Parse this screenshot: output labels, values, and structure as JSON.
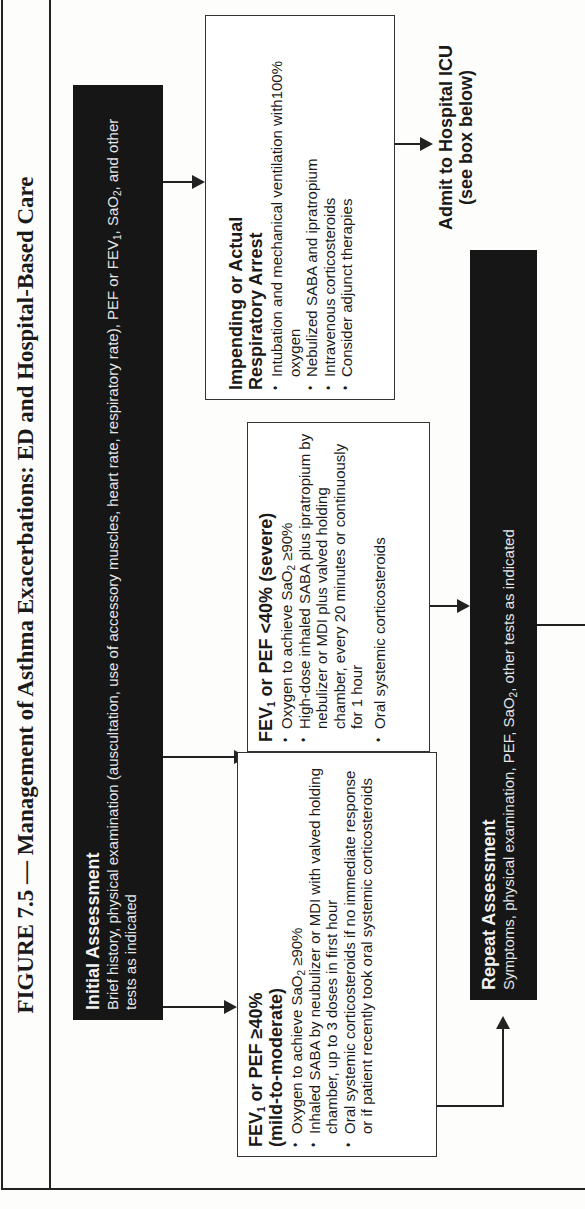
{
  "figure": {
    "title": "FIGURE 7.5 — Management of Asthma Exacerbations: ED and Hospital-Based Care",
    "orientation": "rotated 90° counter-clockwise"
  },
  "initial_assessment": {
    "heading": "Initial Assessment",
    "body_1": "Brief history, physical examination (auscultation, use of accessory muscles, heart rate, respiratory rate), PEF or FEV",
    "body_sub_1": "1",
    "body_2": ", SaO",
    "body_sub_2": "2",
    "body_3": ", and other tests as indicated"
  },
  "mild_box": {
    "heading_pre": "FEV",
    "heading_sub": "1",
    "heading_post": " or PEF ≥40%",
    "heading_line2": "(mild-to-moderate)",
    "items": [
      {
        "pre": "Oxygen to achieve SaO",
        "sub": "2",
        "post": " ≥90%"
      },
      {
        "pre": "Inhaled SABA by neubulizer or MDI with valved holding chamber, up to 3 doses in first hour",
        "sub": "",
        "post": ""
      },
      {
        "pre": "Oral systemic corticosteroids if no immediate response or if patient recently took oral systemic corticosteroids",
        "sub": "",
        "post": ""
      }
    ]
  },
  "severe_box": {
    "heading_pre": "FEV",
    "heading_sub": "1",
    "heading_post": " or PEF <40% (severe)",
    "items": [
      {
        "pre": "Oxygen to achieve SaO",
        "sub": "2",
        "post": " ≥90%"
      },
      {
        "pre": "High-dose inhaled SABA plus ipratropium by nebulizer or MDI plus valved holding chamber, every 20 minutes or continuously for 1 hour",
        "sub": "",
        "post": ""
      },
      {
        "pre": "Oral systemic corticosteroids",
        "sub": "",
        "post": ""
      }
    ]
  },
  "arrest_box": {
    "heading_line1": "Impending or Actual",
    "heading_line2": "Respiratory Arrest",
    "items": [
      "Intubation and mechanical ventilation with100% oxygen",
      "Nebulized SABA and ipratropium",
      "Intravenous corticosteroids",
      "Consider adjunct therapies"
    ]
  },
  "admit": {
    "line1": "Admit to Hospital ICU",
    "line2": "(see box below)"
  },
  "repeat_assessment": {
    "heading": "Repeat Assessment",
    "body_pre": "Symptoms, physical examination, PEF, SaO",
    "body_sub": "2",
    "body_post": ", other tests as indicated"
  }
}
